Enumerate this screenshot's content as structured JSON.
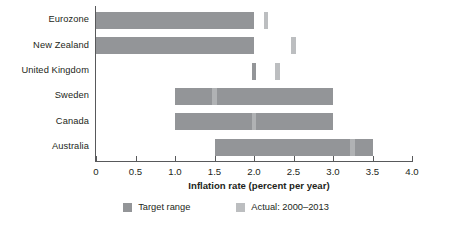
{
  "chart_data": {
    "type": "bar",
    "title": "",
    "xlabel": "Inflation rate (percent per year)",
    "ylabel": "",
    "xlim": [
      0,
      4.0
    ],
    "xticks": [
      0,
      0.5,
      1.0,
      1.5,
      2.0,
      2.5,
      3.0,
      3.5,
      4.0
    ],
    "xtick_labels": [
      "0",
      "0.5",
      "1.0",
      "1.5",
      "2.0",
      "2.5",
      "3.0",
      "3.5",
      "4.0"
    ],
    "grid": false,
    "legend_position": "bottom",
    "orientation": "horizontal",
    "categories": [
      "Eurozone",
      "New Zealand",
      "United Kingdom",
      "Sweden",
      "Canada",
      "Australia"
    ],
    "series": [
      {
        "name": "Target range",
        "type": "range",
        "color": "#939598",
        "values": [
          {
            "category": "Eurozone",
            "low": 0.0,
            "high": 2.0
          },
          {
            "category": "New Zealand",
            "low": 0.0,
            "high": 2.0
          },
          {
            "category": "United Kingdom",
            "low": 2.0,
            "high": 2.0
          },
          {
            "category": "Sweden",
            "low": 1.0,
            "high": 3.0
          },
          {
            "category": "Canada",
            "low": 1.0,
            "high": 3.0
          },
          {
            "category": "Australia",
            "low": 1.5,
            "high": 3.5
          }
        ]
      },
      {
        "name": "Actual: 2000–2013",
        "type": "marker",
        "color": "#bcbec0",
        "values": [
          {
            "category": "Eurozone",
            "value": 2.15
          },
          {
            "category": "New Zealand",
            "value": 2.5
          },
          {
            "category": "United Kingdom",
            "value": 2.3
          },
          {
            "category": "Sweden",
            "value": 1.5
          },
          {
            "category": "Canada",
            "value": 2.0
          },
          {
            "category": "Australia",
            "value": 3.25
          }
        ]
      }
    ]
  },
  "legend": {
    "items": [
      {
        "label": "Target range",
        "color": "#939598"
      },
      {
        "label": "Actual: 2000–2013",
        "color": "#bcbec0"
      }
    ]
  }
}
